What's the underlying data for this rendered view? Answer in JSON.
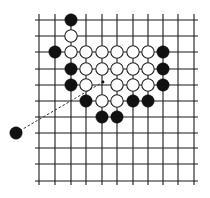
{
  "diagram": {
    "type": "go-board-position",
    "grid": {
      "columns": 11,
      "rows": 11,
      "x_positions": [
        39,
        55,
        71,
        86,
        102,
        117,
        133,
        148,
        163,
        178,
        194
      ],
      "y_positions": [
        20,
        36,
        52,
        69,
        85,
        101,
        117,
        133,
        148,
        164,
        181
      ],
      "line_color": "#1a1a1a",
      "line_overhang": 4
    },
    "stone_radius": 6.2,
    "colors": {
      "black": "#111111",
      "white_fill": "#ffffff",
      "white_stroke": "#222222"
    },
    "stones": [
      {
        "color": "black",
        "col": 2,
        "row": 0
      },
      {
        "color": "white",
        "col": 2,
        "row": 1
      },
      {
        "color": "black",
        "col": 1,
        "row": 2
      },
      {
        "color": "white",
        "col": 2,
        "row": 2
      },
      {
        "color": "white",
        "col": 3,
        "row": 2
      },
      {
        "color": "white",
        "col": 4,
        "row": 2
      },
      {
        "color": "white",
        "col": 5,
        "row": 2
      },
      {
        "color": "white",
        "col": 6,
        "row": 2
      },
      {
        "color": "white",
        "col": 7,
        "row": 2
      },
      {
        "color": "black",
        "col": 8,
        "row": 2
      },
      {
        "color": "black",
        "col": 2,
        "row": 3
      },
      {
        "color": "white",
        "col": 3,
        "row": 3
      },
      {
        "color": "white",
        "col": 4,
        "row": 3
      },
      {
        "color": "white",
        "col": 5,
        "row": 3
      },
      {
        "color": "white",
        "col": 6,
        "row": 3
      },
      {
        "color": "white",
        "col": 7,
        "row": 3
      },
      {
        "color": "black",
        "col": 8,
        "row": 3
      },
      {
        "color": "black",
        "col": 2,
        "row": 4
      },
      {
        "color": "white",
        "col": 3,
        "row": 4
      },
      {
        "color": "white",
        "col": 5,
        "row": 4
      },
      {
        "color": "white",
        "col": 6,
        "row": 4
      },
      {
        "color": "white",
        "col": 7,
        "row": 4
      },
      {
        "color": "black",
        "col": 8,
        "row": 4
      },
      {
        "color": "black",
        "col": 3,
        "row": 5
      },
      {
        "color": "white",
        "col": 4,
        "row": 5
      },
      {
        "color": "white",
        "col": 5,
        "row": 5
      },
      {
        "color": "black",
        "col": 6,
        "row": 5
      },
      {
        "color": "black",
        "col": 7,
        "row": 5
      },
      {
        "color": "black",
        "col": 4,
        "row": 6
      },
      {
        "color": "black",
        "col": 5,
        "row": 6
      }
    ],
    "external_stone": {
      "color": "black",
      "x": 16,
      "y": 133
    },
    "dashed_arrow": {
      "from": {
        "x": 16,
        "y": 133
      },
      "to": {
        "x": 103,
        "y": 82
      },
      "target_point": {
        "col": 4,
        "row": 4
      }
    }
  }
}
